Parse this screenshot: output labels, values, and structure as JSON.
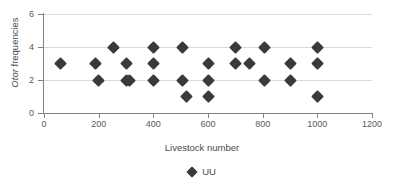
{
  "chart_data": {
    "type": "scatter",
    "title": "",
    "xlabel": "Livestock number",
    "ylabel": "Otor frequencies",
    "ylabel_italic_part": "Otor",
    "ylabel_rest": " frequencies",
    "xlim": [
      0,
      1200
    ],
    "ylim": [
      0,
      6
    ],
    "xticks": [
      0,
      200,
      400,
      600,
      800,
      1000,
      1200
    ],
    "yticks": [
      0,
      2,
      4,
      6
    ],
    "grid": "horizontal",
    "legend_position": "bottom-center",
    "marker": "diamond",
    "marker_color": "#3a3a3a",
    "series": [
      {
        "name": "UU",
        "points": [
          [
            60,
            3
          ],
          [
            190,
            3
          ],
          [
            200,
            2
          ],
          [
            255,
            4
          ],
          [
            300,
            3
          ],
          [
            300,
            2
          ],
          [
            312,
            2
          ],
          [
            400,
            4
          ],
          [
            400,
            3
          ],
          [
            400,
            2
          ],
          [
            505,
            4
          ],
          [
            505,
            2
          ],
          [
            520,
            1
          ],
          [
            600,
            3
          ],
          [
            600,
            2
          ],
          [
            600,
            1
          ],
          [
            700,
            4
          ],
          [
            700,
            3
          ],
          [
            750,
            3
          ],
          [
            805,
            4
          ],
          [
            805,
            2
          ],
          [
            900,
            3
          ],
          [
            900,
            2
          ],
          [
            1000,
            4
          ],
          [
            1000,
            3
          ],
          [
            1000,
            1
          ]
        ]
      }
    ]
  },
  "axis": {
    "x_tick_labels": [
      "0",
      "200",
      "400",
      "600",
      "800",
      "1000",
      "1200"
    ],
    "y_tick_labels": [
      "0",
      "2",
      "4",
      "6"
    ],
    "x_title": "Livestock number",
    "y_title_italic": "Otor",
    "y_title_rest": " frequencies"
  },
  "legend": {
    "entries": [
      {
        "label": "UU",
        "marker": "diamond-marker-icon",
        "color": "#3a3a3a"
      }
    ]
  },
  "colors": {
    "marker": "#3a3a3a",
    "grid": "#d9d9d9",
    "axis": "#808080",
    "text": "#4a4a4a",
    "background": "#ffffff"
  }
}
